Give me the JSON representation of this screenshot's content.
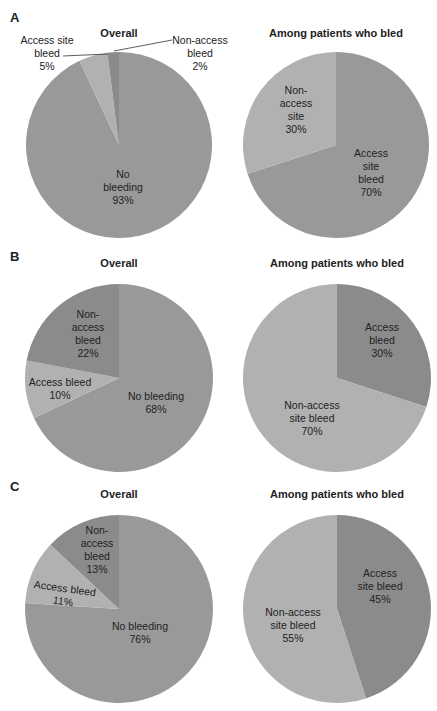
{
  "colors": {
    "dark": "#8b8b8b",
    "mid": "#999999",
    "light": "#b1b1b1"
  },
  "panels": [
    {
      "letter": "A",
      "overall": {
        "title": "Overall",
        "labels": {
          "access": "Access site\nbleed\n5%",
          "nonaccess": "Non-access\nbleed\n2%",
          "none": "No\nbleeding\n93%"
        }
      },
      "bled": {
        "title": "Among patients who bled",
        "labels": {
          "nonaccess": "Non-\naccess\nsite\n30%",
          "access": "Access\nsite\nbleed\n70%"
        }
      }
    },
    {
      "letter": "B",
      "overall": {
        "title": "Overall",
        "labels": {
          "nonaccess": "Non-\naccess\nbleed\n22%",
          "access": "Access bleed\n10%",
          "none": "No bleeding\n68%"
        }
      },
      "bled": {
        "title": "Among patients who bled",
        "labels": {
          "access": "Access\nbleed\n30%",
          "nonaccess": "Non-access\nsite bleed\n70%"
        }
      }
    },
    {
      "letter": "C",
      "overall": {
        "title": "Overall",
        "labels": {
          "nonaccess": "Non-\naccess\nbleed\n13%",
          "access": "Access bleed\n11%",
          "none": "No bleeding\n76%"
        }
      },
      "bled": {
        "title": "Among patients who bled",
        "labels": {
          "access": "Access\nsite bleed\n45%",
          "nonaccess": "Non-access\nsite bleed\n55%"
        }
      }
    }
  ],
  "chart_data": [
    {
      "type": "pie",
      "title": "A — Overall",
      "categories": [
        "No bleeding",
        "Access site bleed",
        "Non-access bleed"
      ],
      "values": [
        93,
        5,
        2
      ]
    },
    {
      "type": "pie",
      "title": "A — Among patients who bled",
      "categories": [
        "Access site bleed",
        "Non-access site"
      ],
      "values": [
        70,
        30
      ]
    },
    {
      "type": "pie",
      "title": "B — Overall",
      "categories": [
        "No bleeding",
        "Access bleed",
        "Non-access bleed"
      ],
      "values": [
        68,
        10,
        22
      ]
    },
    {
      "type": "pie",
      "title": "B — Among patients who bled",
      "categories": [
        "Access bleed",
        "Non-access site bleed"
      ],
      "values": [
        30,
        70
      ]
    },
    {
      "type": "pie",
      "title": "C — Overall",
      "categories": [
        "No bleeding",
        "Access bleed",
        "Non-access bleed"
      ],
      "values": [
        76,
        11,
        13
      ]
    },
    {
      "type": "pie",
      "title": "C — Among patients who bled",
      "categories": [
        "Access site bleed",
        "Non-access site bleed"
      ],
      "values": [
        45,
        55
      ]
    }
  ]
}
